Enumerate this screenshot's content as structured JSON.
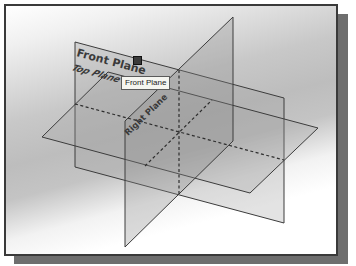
{
  "viewport": {
    "background_top": "#ffffff",
    "background_mid": "#c0c0c0",
    "border_color": "#3a3a3a",
    "shadow_color": "#6e6e6e"
  },
  "planes": {
    "front": {
      "label": "Front Plane",
      "fill": "#9a9a9a"
    },
    "top": {
      "label": "Top Plane",
      "fill": "#a8a8a8"
    },
    "right": {
      "label": "Right Plane",
      "fill": "#8f8f8f"
    }
  },
  "tooltip": {
    "text": "Front Plane"
  },
  "icons": {
    "selection_handle": "square-handle-icon"
  }
}
